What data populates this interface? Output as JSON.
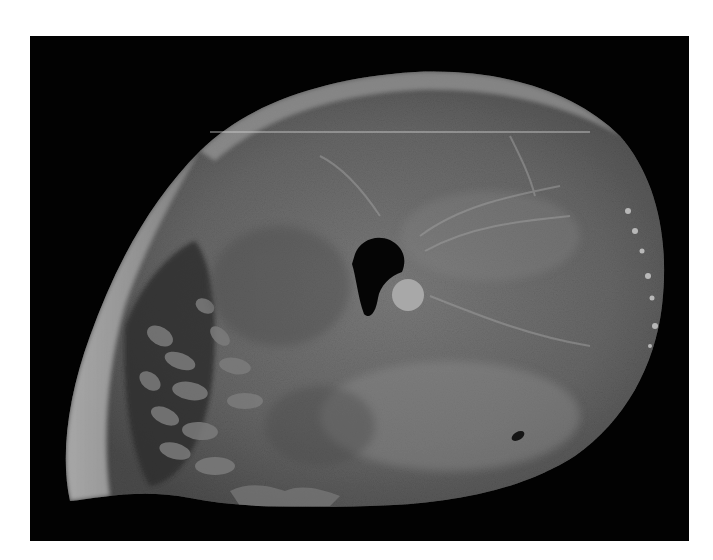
{
  "page": {
    "background": "#ffffff",
    "width": 713,
    "height": 560
  },
  "photo": {
    "frame": {
      "left": 30,
      "top": 36,
      "width": 659,
      "height": 505,
      "background": "#020202"
    },
    "specimen": {
      "outline_path": "M 40 465 C 30 420, 38 360, 60 300 C 85 230, 120 165, 170 115 C 215 70, 290 42, 385 36 C 470 32, 545 55, 590 100 C 625 140, 640 200, 632 270 C 625 330, 595 385, 545 420 C 490 455, 420 468, 340 470 C 270 472, 210 472, 160 462 C 110 452, 70 462, 40 465 Z",
      "base_gray": "#6a6a6a",
      "epicardial_rim_gray": "#b4b4b4",
      "trabecular_zone_gray": "#3c3c3c",
      "cavity": {
        "path": "M 325 218 C 330 205, 345 198, 360 204 C 372 210, 378 222, 372 236 C 360 240, 350 250, 348 262 C 346 276, 340 284, 334 278 C 328 262, 326 240, 322 228 Z",
        "color": "#050505"
      },
      "papillary_muscle": {
        "cx": 378,
        "cy": 259,
        "r": 16,
        "color": "#a8a8a8"
      },
      "scan_line": {
        "y": 96,
        "x1": 180,
        "x2": 560,
        "color": "#d8d8d8"
      }
    }
  }
}
